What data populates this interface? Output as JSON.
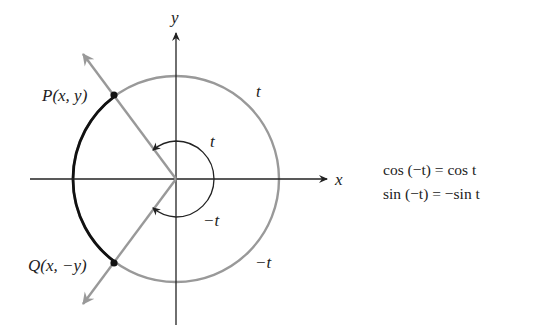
{
  "diagram": {
    "axes": {
      "x_label": "x",
      "y_label": "y"
    },
    "points": {
      "P": {
        "label": "P(x, y)"
      },
      "Q": {
        "label": "Q(x, −y)"
      }
    },
    "arc_labels": {
      "upper_arc": "t",
      "lower_arc": "−t",
      "angle_pos": "t",
      "angle_neg": "−t"
    },
    "colors": {
      "circle": "#999999",
      "highlight_arc": "#111111",
      "rays": "#999999",
      "axes": "#222222",
      "points": "#111111"
    }
  },
  "equations": [
    "cos (−t) = cos t",
    "sin (−t) = −sin t"
  ]
}
